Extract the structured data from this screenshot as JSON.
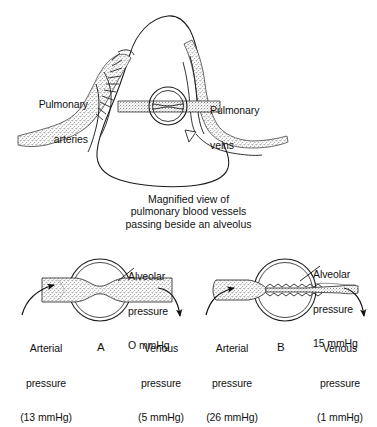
{
  "figure": {
    "title_caption": {
      "line1": "Magnified view of",
      "line2": "pulmonary blood vessels",
      "line3": "passing beside an alveolus"
    },
    "top_diagram": {
      "left_label": {
        "line1": "Pulmonary",
        "line2": "arteries"
      },
      "right_label": {
        "line1": "Pulmonary",
        "line2": "veins"
      }
    },
    "panels": [
      {
        "letter": "A",
        "alveolar": {
          "line1": "Alveolar",
          "line2": "pressure",
          "line3": "O mmHg"
        },
        "arterial": {
          "line1": "Arterial",
          "line2": "pressure",
          "line3": "(13 mmHg)"
        },
        "venous": {
          "line1": "Venous",
          "line2": "pressure",
          "line3": "(5 mmHg)"
        }
      },
      {
        "letter": "B",
        "alveolar": {
          "line1": "Alveolar",
          "line2": "pressure",
          "line3": "15 mmHg"
        },
        "arterial": {
          "line1": "Arterial",
          "line2": "pressure",
          "line3": "(26 mmHg)"
        },
        "venous": {
          "line1": "Venous",
          "line2": "pressure",
          "line3": "(1 mmHg)"
        }
      }
    ],
    "colors": {
      "ink": "#111111",
      "stipple": "#6e6e6e",
      "background": "#ffffff"
    }
  }
}
